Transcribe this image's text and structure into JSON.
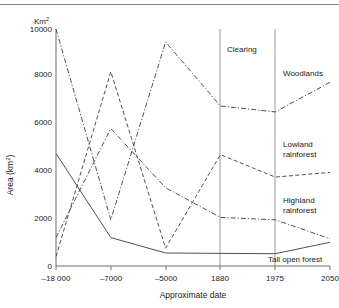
{
  "figure": {
    "unit_label": "Km",
    "unit_sup": "2",
    "top_rule": true
  },
  "chart_data": {
    "type": "line",
    "title": "",
    "xlabel": "Approximate date",
    "ylabel_prefix": "Area (km",
    "ylabel_sup": "2",
    "ylabel_suffix": ")",
    "ylabel": "Area (km2)",
    "categories": [
      "-18 000",
      "-7000",
      "-5000",
      "1880",
      "1975",
      "2050"
    ],
    "x_positions": [
      0,
      1,
      2,
      3,
      4,
      5
    ],
    "xticklabels": [
      "–18 000",
      "–7000",
      "–5000",
      "1880",
      "1975",
      "2050"
    ],
    "yticks": [
      0,
      2000,
      4000,
      6000,
      8000,
      10000
    ],
    "yticklabels": [
      "0",
      "2000",
      "4000",
      "6000",
      "8000",
      "10000"
    ],
    "ylim": [
      0,
      10000
    ],
    "grid": false,
    "legend_position": "inline-right-labels",
    "annotations": [
      {
        "text": "Clearing",
        "between_x": [
          3,
          4
        ],
        "y": 9000
      }
    ],
    "vertical_lines": [
      {
        "at": "1880",
        "x_index": 3
      },
      {
        "at": "1975",
        "x_index": 4
      }
    ],
    "series": [
      {
        "name": "Woodlands",
        "label": "Woodlands",
        "style": "dash-dot",
        "values": [
          10000,
          1950,
          9450,
          6750,
          6500,
          7750
        ],
        "label_x_index": 5,
        "label_y": 8050
      },
      {
        "name": "Lowland rainforest",
        "label_line1": "Lowland",
        "label_line2": "rainforest",
        "label": "Lowland rainforest",
        "style": "dashed",
        "values": [
          400,
          8200,
          750,
          4700,
          3750,
          3950
        ],
        "label_x_index": 5,
        "label_y": 4850
      },
      {
        "name": "Highland rainforest",
        "label_line1": "Highland",
        "label_line2": "rainforest",
        "label": "Highland rainforest",
        "style": "dash-dot",
        "values": [
          1200,
          5800,
          3300,
          2050,
          1950,
          1150
        ],
        "label_x_index": 5,
        "label_y": 2400
      },
      {
        "name": "Tall open forest",
        "label": "Tall open forest",
        "style": "solid",
        "values": [
          4750,
          1200,
          550,
          530,
          520,
          1000
        ],
        "label_x_index": 5,
        "label_y": 330
      }
    ]
  }
}
